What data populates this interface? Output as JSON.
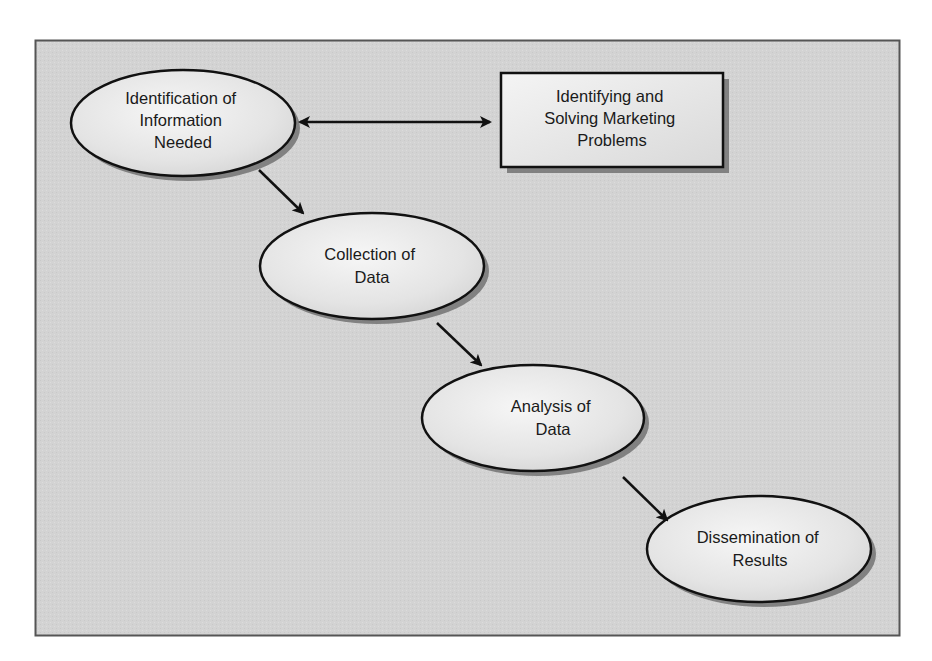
{
  "caption_fragment": "Chapter 1  Marketing Research Process",
  "diagram": {
    "type": "flowchart",
    "background_color": "#d3d3d3",
    "node_fill": "#eeeeee",
    "stroke_color": "#111111",
    "nodes": [
      {
        "id": "n1",
        "shape": "ellipse",
        "lines": [
          "Identification of",
          "Information",
          "Needed"
        ]
      },
      {
        "id": "n2",
        "shape": "rectangle",
        "lines": [
          "Identifying and",
          "Solving Marketing",
          "Problems"
        ]
      },
      {
        "id": "n3",
        "shape": "ellipse",
        "lines": [
          "Collection of",
          "Data"
        ]
      },
      {
        "id": "n4",
        "shape": "ellipse",
        "lines": [
          "Analysis of",
          "Data"
        ]
      },
      {
        "id": "n5",
        "shape": "ellipse",
        "lines": [
          "Dissemination of",
          "Results"
        ]
      }
    ],
    "edges": [
      {
        "from": "n1",
        "to": "n2",
        "direction": "both"
      },
      {
        "from": "n1",
        "to": "n3",
        "direction": "forward"
      },
      {
        "from": "n3",
        "to": "n4",
        "direction": "forward"
      },
      {
        "from": "n4",
        "to": "n5",
        "direction": "forward"
      }
    ]
  }
}
